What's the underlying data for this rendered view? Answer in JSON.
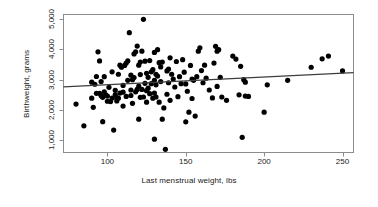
{
  "chart_data": {
    "type": "scatter",
    "title": "",
    "xlabel": "Last menstrual weight, lbs",
    "ylabel": "Birthweight, grams",
    "xlim": [
      72,
      257
    ],
    "ylim": [
      600,
      5150
    ],
    "xticks": [
      100,
      150,
      200,
      250
    ],
    "xtick_labels": [
      "100",
      "150",
      "200",
      "250"
    ],
    "yticks": [
      1000,
      2000,
      3000,
      4000,
      5000
    ],
    "ytick_labels": [
      "1,000",
      "2,000",
      "3,000",
      "4,000",
      "5,000"
    ],
    "grid": false,
    "legend": null,
    "frame": true,
    "marker": {
      "shape": "circle",
      "color": "#000000",
      "size": 2.6
    },
    "trendline": {
      "type": "linear-fit",
      "color": "#3d3d3d",
      "x_start": 72,
      "y_start": 2765,
      "x_end": 257,
      "y_end": 3235
    },
    "points": [
      [
        80,
        2195
      ],
      [
        85,
        1480
      ],
      [
        90,
        2390
      ],
      [
        90,
        2920
      ],
      [
        91,
        2090
      ],
      [
        92,
        2850
      ],
      [
        93,
        2550
      ],
      [
        93,
        3105
      ],
      [
        94,
        3920
      ],
      [
        95,
        3620
      ],
      [
        95,
        2550
      ],
      [
        96,
        2940
      ],
      [
        96,
        2470
      ],
      [
        97,
        1615
      ],
      [
        97,
        2420
      ],
      [
        98,
        2600
      ],
      [
        98,
        3100
      ],
      [
        99,
        2500
      ],
      [
        100,
        2460
      ],
      [
        100,
        2290
      ],
      [
        101,
        2750
      ],
      [
        102,
        2280
      ],
      [
        103,
        3260
      ],
      [
        103,
        2395
      ],
      [
        104,
        1340
      ],
      [
        105,
        2500
      ],
      [
        105,
        2650
      ],
      [
        106,
        2400
      ],
      [
        106,
        2300
      ],
      [
        107,
        2390
      ],
      [
        107,
        3180
      ],
      [
        108,
        2560
      ],
      [
        108,
        3480
      ],
      [
        109,
        3410
      ],
      [
        110,
        2810
      ],
      [
        110,
        2130
      ],
      [
        110,
        2590
      ],
      [
        111,
        3470
      ],
      [
        112,
        3550
      ],
      [
        112,
        2450
      ],
      [
        113,
        2980
      ],
      [
        113,
        3620
      ],
      [
        114,
        4550
      ],
      [
        115,
        2660
      ],
      [
        115,
        2480
      ],
      [
        115,
        3150
      ],
      [
        116,
        3000
      ],
      [
        116,
        2220
      ],
      [
        117,
        3850
      ],
      [
        117,
        3070
      ],
      [
        118,
        2600
      ],
      [
        118,
        3920
      ],
      [
        119,
        4110
      ],
      [
        119,
        2680
      ],
      [
        120,
        3480
      ],
      [
        120,
        2790
      ],
      [
        120,
        1700
      ],
      [
        121,
        3580
      ],
      [
        121,
        2420
      ],
      [
        121,
        3170
      ],
      [
        122,
        3940
      ],
      [
        122,
        2680
      ],
      [
        123,
        4990
      ],
      [
        123,
        2430
      ],
      [
        124,
        3610
      ],
      [
        124,
        2880
      ],
      [
        125,
        3210
      ],
      [
        125,
        2640
      ],
      [
        125,
        2260
      ],
      [
        126,
        3080
      ],
      [
        126,
        2720
      ],
      [
        127,
        3630
      ],
      [
        127,
        2540
      ],
      [
        128,
        2870
      ],
      [
        128,
        3260
      ],
      [
        129,
        3330
      ],
      [
        129,
        2390
      ],
      [
        130,
        3900
      ],
      [
        130,
        2980
      ],
      [
        130,
        2560
      ],
      [
        130,
        1040
      ],
      [
        131,
        3180
      ],
      [
        131,
        2430
      ],
      [
        131,
        2830
      ],
      [
        132,
        3990
      ],
      [
        132,
        3120
      ],
      [
        133,
        2260
      ],
      [
        133,
        3560
      ],
      [
        134,
        3420
      ],
      [
        134,
        2940
      ],
      [
        135,
        3580
      ],
      [
        135,
        1700
      ],
      [
        136,
        2070
      ],
      [
        137,
        705
      ],
      [
        138,
        3290
      ],
      [
        138,
        2520
      ],
      [
        139,
        3350
      ],
      [
        139,
        2900
      ],
      [
        140,
        3720
      ],
      [
        140,
        2320
      ],
      [
        141,
        3180
      ],
      [
        142,
        3020
      ],
      [
        143,
        2760
      ],
      [
        144,
        3600
      ],
      [
        145,
        2440
      ],
      [
        146,
        3100
      ],
      [
        147,
        2870
      ],
      [
        148,
        3660
      ],
      [
        149,
        3250
      ],
      [
        150,
        1610
      ],
      [
        150,
        2860
      ],
      [
        151,
        2620
      ],
      [
        152,
        1930
      ],
      [
        153,
        3470
      ],
      [
        154,
        2380
      ],
      [
        154,
        3020
      ],
      [
        155,
        2980
      ],
      [
        156,
        1800
      ],
      [
        157,
        3100
      ],
      [
        158,
        3940
      ],
      [
        159,
        4050
      ],
      [
        160,
        3300
      ],
      [
        161,
        2900
      ],
      [
        162,
        3480
      ],
      [
        163,
        3050
      ],
      [
        165,
        2660
      ],
      [
        167,
        2400
      ],
      [
        168,
        3550
      ],
      [
        169,
        4100
      ],
      [
        170,
        3940
      ],
      [
        170,
        2780
      ],
      [
        171,
        3990
      ],
      [
        172,
        3080
      ],
      [
        173,
        2430
      ],
      [
        176,
        2320
      ],
      [
        180,
        3780
      ],
      [
        182,
        3680
      ],
      [
        184,
        2500
      ],
      [
        185,
        3440
      ],
      [
        186,
        1100
      ],
      [
        187,
        3000
      ],
      [
        188,
        2920
      ],
      [
        188,
        2460
      ],
      [
        190,
        2450
      ],
      [
        200,
        1930
      ],
      [
        202,
        2830
      ],
      [
        215,
        2980
      ],
      [
        230,
        3410
      ],
      [
        237,
        3690
      ],
      [
        241,
        3780
      ],
      [
        250,
        3290
      ]
    ]
  },
  "axes": {
    "x_title": "Last menstrual weight, lbs",
    "y_title": "Birthweight, grams"
  }
}
